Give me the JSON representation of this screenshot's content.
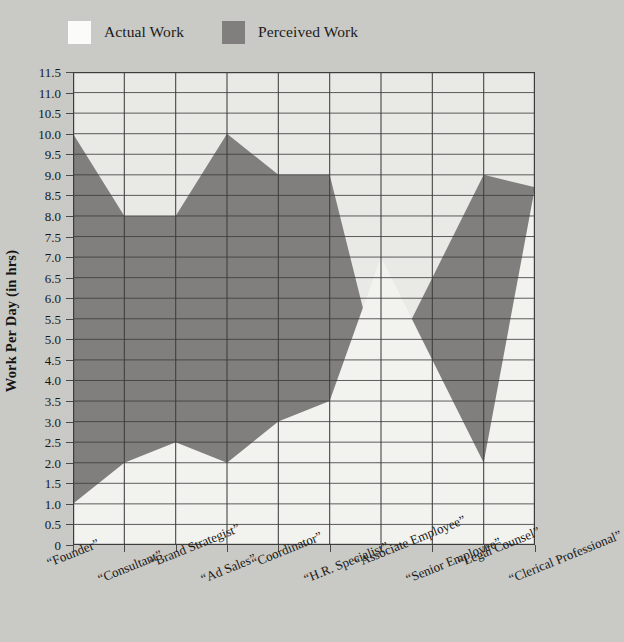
{
  "legend": {
    "items": [
      {
        "label": "Actual Work",
        "color": "#fbfbfa",
        "key": "actual"
      },
      {
        "label": "Perceived Work",
        "color": "#807f7d",
        "key": "perceived"
      }
    ]
  },
  "axes": {
    "y_title": "Work Per Day (in hrs)",
    "y_ticks": [
      "11.5",
      "11.0",
      "10.5",
      "10.0",
      "9.5",
      "9.0",
      "8.5",
      "8.0",
      "7.5",
      "7.0",
      "6.5",
      "6.0",
      "5.5",
      "5.0",
      "4.5",
      "4.0",
      "3.5",
      "3.0",
      "2.5",
      "2.0",
      "1.5",
      "1.0",
      "0.5",
      "0"
    ],
    "x_title": ""
  },
  "colors": {
    "background": "#c9c9c5",
    "plot_background": "#e9e9e5",
    "actual_area": "#f2f2ef",
    "perceived_area": "#807f7d",
    "gridline": "#3d3d3d",
    "axis": "#3d3d3d"
  },
  "chart_data": {
    "type": "area",
    "title": "",
    "xlabel": "",
    "ylabel": "Work Per Day (in hrs)",
    "ylim": [
      0,
      11.5
    ],
    "ytick_step": 0.5,
    "grid": true,
    "legend_position": "top-left",
    "categories": [
      "“Founder”",
      "“Consultant”",
      "“Brand Strategist”",
      "“Ad Sales”",
      "“Coordinator”",
      "“H.R. Specialist”",
      "“Associate Employee”",
      "“Senior Employee”",
      "“Legal Counsel”",
      "“Clerical Professional”"
    ],
    "series": [
      {
        "name": "Actual Work",
        "color": "#f2f2ef",
        "values": [
          1.0,
          2.0,
          2.5,
          2.0,
          3.0,
          3.5,
          7.0,
          4.5,
          2.0,
          8.7
        ]
      },
      {
        "name": "Perceived Work",
        "color": "#807f7d",
        "values": [
          10.0,
          8.0,
          8.0,
          10.0,
          9.0,
          9.0,
          4.0,
          6.5,
          9.0,
          8.7
        ]
      }
    ]
  }
}
